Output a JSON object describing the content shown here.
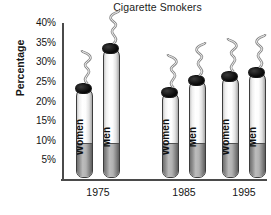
{
  "chart_data": {
    "type": "bar",
    "title": "Cigarette Smokers",
    "xlabel": "",
    "ylabel": "Percentage",
    "categories": [
      "1975",
      "1985",
      "1995"
    ],
    "series": [
      {
        "name": "Women",
        "values": [
          23,
          22,
          26
        ]
      },
      {
        "name": "Men",
        "values": [
          33,
          25,
          27
        ]
      }
    ],
    "ylim": [
      0,
      40
    ],
    "ytick_labels": [
      "40%",
      "35%",
      "30%",
      "25%",
      "20%",
      "15%",
      "10%",
      "5%"
    ],
    "ytick_values": [
      40,
      35,
      30,
      25,
      20,
      15,
      10,
      5
    ],
    "grid": false,
    "legend": "none",
    "bar_style": "cigarette-pictograph",
    "annotations": [
      "smoke-squiggle above each bar"
    ]
  },
  "axis": {
    "y_title": "Percentage"
  },
  "colors": {
    "background": "#ffffff",
    "axis": "#4a4a4a",
    "text": "#141414",
    "cigarette_paper": "#ffffff",
    "cigarette_filter": "#8d8d8d",
    "cigarette_tip": "#000000"
  }
}
